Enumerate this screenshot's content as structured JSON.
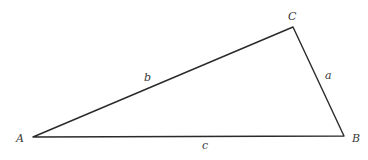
{
  "diagram": {
    "type": "triangle",
    "vertices": [
      {
        "id": "A",
        "label": "A",
        "x": 33,
        "y": 137,
        "label_x": 16,
        "label_y": 142
      },
      {
        "id": "B",
        "label": "B",
        "x": 344,
        "y": 136,
        "label_x": 352,
        "label_y": 142
      },
      {
        "id": "C",
        "label": "C",
        "x": 293,
        "y": 27,
        "label_x": 288,
        "label_y": 20
      }
    ],
    "sides": [
      {
        "id": "a",
        "label": "a",
        "from": "B",
        "to": "C",
        "label_x": 325,
        "label_y": 79
      },
      {
        "id": "b",
        "label": "b",
        "from": "A",
        "to": "C",
        "label_x": 144,
        "label_y": 81
      },
      {
        "id": "c",
        "label": "c",
        "from": "A",
        "to": "B",
        "label_x": 202,
        "label_y": 149
      }
    ],
    "stroke_color": "#2a2a2a",
    "background": "#ffffff"
  }
}
